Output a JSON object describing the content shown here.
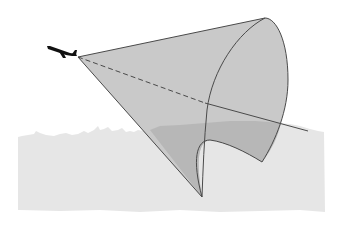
{
  "diagram": {
    "description": "Aircraft emitting a conical beam/field of view toward a city skyline",
    "elements": {
      "aircraft": "airplane-silhouette",
      "beam": "cone",
      "axis": "beam-centerline",
      "ground": "city-skyline"
    }
  },
  "colors": {
    "background": "#ffffff",
    "skyline": "#e6e6e6",
    "cone_fill": "#c8c8c8",
    "cone_overlap": "#b3b3b3",
    "outline": "#4a4a4a",
    "aircraft": "#111111"
  }
}
